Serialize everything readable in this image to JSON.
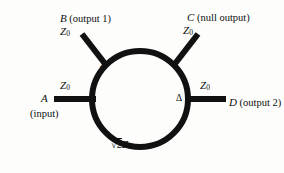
{
  "figure": {
    "type": "rat-race-hybrid-ring-coupler",
    "ring_label": "√2Z₀",
    "ring_label_radical": "√",
    "ring_label_body": "2",
    "ring_label_z": "Z",
    "ring_label_sub": "0"
  },
  "ports": {
    "a": {
      "letter": "A",
      "desc": "(input)",
      "impedance_z": "Z",
      "impedance_sub": "0"
    },
    "b": {
      "letter": "B",
      "desc": "(output 1)",
      "impedance_z": "Z",
      "impedance_sub": "0"
    },
    "c": {
      "letter": "C",
      "desc": "(null output)",
      "impedance_z": "Z",
      "impedance_sub": "0"
    },
    "d": {
      "letter": "D",
      "desc": "(output 2)",
      "impedance_z": "Z",
      "impedance_sub": "0"
    }
  },
  "nodes": {
    "sigma": "Σ",
    "delta": "Δ"
  },
  "colors": {
    "line": "#111111",
    "background": "#fdfdfc",
    "text": "#0d0d0d"
  }
}
